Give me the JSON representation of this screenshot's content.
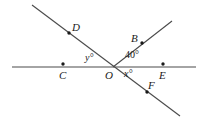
{
  "figure": {
    "type": "geometry-diagram",
    "stroke_color": "#4a4a4a",
    "text_color": "#1a1a1a",
    "background": "#ffffff",
    "width": 204,
    "height": 122
  },
  "lines": [
    {
      "name": "horizontal-line-CE",
      "through_points": [
        "C",
        "O",
        "E"
      ],
      "x1": 12,
      "y1": 67,
      "x2": 196,
      "y2": 67
    },
    {
      "name": "line-DF",
      "through_points": [
        "D",
        "O",
        "F"
      ],
      "x1": 32,
      "y1": 5,
      "x2": 180,
      "y2": 116
    },
    {
      "name": "ray-OB",
      "through_points": [
        "O",
        "B"
      ],
      "x1": 113,
      "y1": 67,
      "x2": 172,
      "y2": 21
    }
  ],
  "points": [
    {
      "name": "point-D",
      "label": "D",
      "dot_x": 69,
      "dot_y": 33,
      "label_x": 72,
      "label_y": 22
    },
    {
      "name": "point-B",
      "label": "B",
      "dot_x": 142,
      "dot_y": 43,
      "label_x": 131,
      "label_y": 33
    },
    {
      "name": "point-C",
      "label": "C",
      "dot_x": 63,
      "dot_y": 64,
      "label_x": 59,
      "label_y": 70
    },
    {
      "name": "point-O",
      "label": "O",
      "dot_x": 113,
      "dot_y": 67,
      "label_x": 105,
      "label_y": 70
    },
    {
      "name": "point-E",
      "label": "E",
      "dot_x": 163,
      "dot_y": 64,
      "label_x": 159,
      "label_y": 70
    },
    {
      "name": "point-F",
      "label": "F",
      "dot_x": 147,
      "dot_y": 92,
      "label_x": 148,
      "label_y": 80
    }
  ],
  "angles": [
    {
      "name": "angle-40-degrees",
      "value": "40",
      "unit": "°",
      "text": "40°",
      "x": 125,
      "y": 50,
      "italic": false
    },
    {
      "name": "angle-x-degrees",
      "value": "x",
      "unit": "°",
      "text": "x°",
      "x": 124,
      "y": 69,
      "italic": true
    },
    {
      "name": "angle-y-degrees",
      "value": "y",
      "unit": "°",
      "text": "y°",
      "x": 85,
      "y": 53,
      "italic": true
    }
  ]
}
